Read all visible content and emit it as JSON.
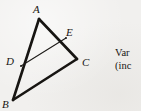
{
  "figure": {
    "type": "geometry-diagram",
    "background_color": "#f1f0ee",
    "ink_color": "#171512",
    "vertices": [
      {
        "name": "A",
        "label": "A",
        "x": 39,
        "y": 19
      },
      {
        "name": "B",
        "label": "B",
        "x": 13,
        "y": 100
      },
      {
        "name": "C",
        "label": "C",
        "x": 77,
        "y": 59
      },
      {
        "name": "D",
        "label": "D",
        "x": 21,
        "y": 66
      },
      {
        "name": "E",
        "label": "E",
        "x": 66,
        "y": 38
      }
    ],
    "segments": [
      {
        "name": "side-AB",
        "from": "A",
        "to": "B",
        "weight": "thick"
      },
      {
        "name": "side-BC",
        "from": "B",
        "to": "C",
        "weight": "thick"
      },
      {
        "name": "side-AC",
        "from": "A",
        "to": "C",
        "weight": "thick"
      },
      {
        "name": "segment-DE",
        "from": "D",
        "to": "E",
        "weight": "thin"
      }
    ]
  },
  "side_text": {
    "line1": "Var",
    "line2": "(inc"
  }
}
